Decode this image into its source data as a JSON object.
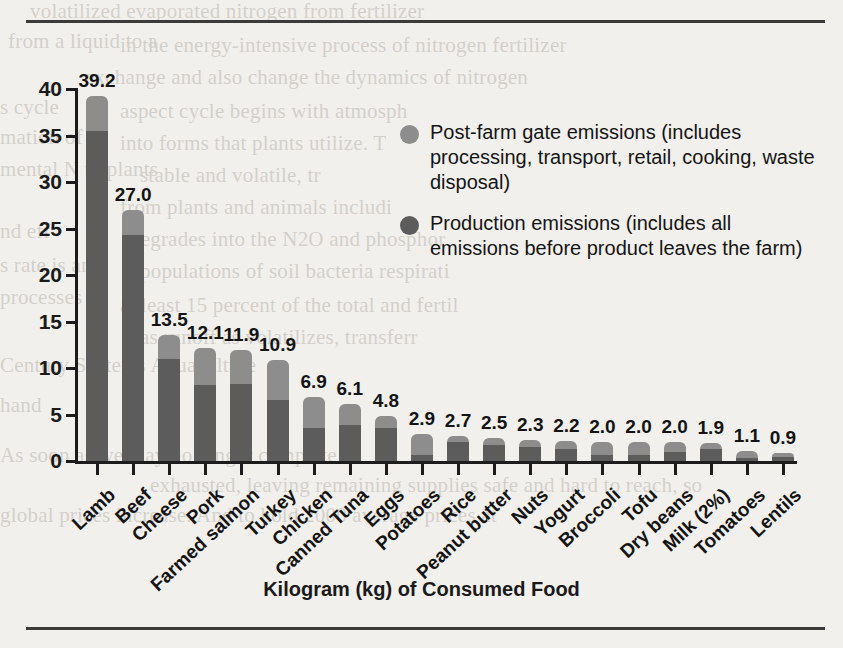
{
  "chart_data": {
    "type": "bar",
    "subtype": "stacked-bar",
    "title": "",
    "xlabel": "Kilogram (kg) of Consumed Food",
    "ylabel": "kg CO2e",
    "ylabel_parts": {
      "prefix": "kg CO",
      "sub": "2",
      "suffix": "e"
    },
    "ylim": [
      0,
      40
    ],
    "yticks": [
      0,
      5,
      10,
      15,
      20,
      25,
      30,
      35,
      40
    ],
    "grid": false,
    "legend_position": "upper-right-inside",
    "categories": [
      "Lamb",
      "Beef",
      "Cheese",
      "Pork",
      "Farmed salmon",
      "Turkey",
      "Chicken",
      "Canned Tuna",
      "Eggs",
      "Potatoes",
      "Rice",
      "Peanut butter",
      "Nuts",
      "Yogurt",
      "Broccoli",
      "Tofu",
      "Dry beans",
      "Milk (2%)",
      "Tomatoes",
      "Lentils"
    ],
    "totals": [
      39.2,
      27.0,
      13.5,
      12.1,
      11.9,
      10.9,
      6.9,
      6.1,
      4.8,
      2.9,
      2.7,
      2.5,
      2.3,
      2.2,
      2.0,
      2.0,
      2.0,
      1.9,
      1.1,
      0.9
    ],
    "series": [
      {
        "name": "Production emissions (includes all emissions before product leaves the farm)",
        "short_name": "Production emissions",
        "color": "#5c5c5c",
        "values": [
          35.5,
          24.3,
          11.0,
          8.2,
          8.3,
          6.6,
          3.5,
          3.9,
          3.5,
          0.6,
          2.0,
          1.7,
          1.5,
          1.3,
          0.7,
          0.7,
          1.0,
          1.3,
          0.3,
          0.4
        ]
      },
      {
        "name": "Post-farm gate emissions (includes processing, transport, retail, cooking, waste disposal)",
        "short_name": "Post-farm gate emissions",
        "color": "#8d8d8d",
        "values": [
          3.7,
          2.7,
          2.5,
          3.9,
          3.6,
          4.3,
          3.4,
          2.2,
          1.3,
          2.3,
          0.7,
          0.8,
          0.8,
          0.9,
          1.3,
          1.3,
          1.0,
          0.6,
          0.8,
          0.5
        ]
      }
    ]
  },
  "legend": {
    "items": [
      {
        "marker": "post",
        "label": "Post-farm gate emissions (includes processing, transport, retail, cooking, waste disposal)"
      },
      {
        "marker": "prod",
        "label": "Production emissions (includes all emissions before product leaves the farm)"
      }
    ]
  },
  "page_bleed": {
    "lines": [
      {
        "x": 30,
        "y": -4,
        "text": "volatilized evaporated nitrogen from fertilizer"
      },
      {
        "x": 8,
        "y": 26,
        "text": "from a liquid to a"
      },
      {
        "x": 120,
        "y": 30,
        "text": "in the energy-intensive process of nitrogen fertilizer"
      },
      {
        "x": 85,
        "y": 62,
        "text": "exchange and also change the dynamics of nitrogen"
      },
      {
        "x": 0,
        "y": 92,
        "text": "s cycle"
      },
      {
        "x": 120,
        "y": 96,
        "text": "aspect cycle begins with atmosph"
      },
      {
        "x": 0,
        "y": 122,
        "text": "mation of"
      },
      {
        "x": 120,
        "y": 128,
        "text": "into forms that plants utilize. T"
      },
      {
        "x": 0,
        "y": 154,
        "text": "mental N to plants"
      },
      {
        "x": 140,
        "y": 160,
        "text": "stable and volatile, tr"
      },
      {
        "x": 120,
        "y": 192,
        "text": "from plants and animals includi"
      },
      {
        "x": 0,
        "y": 216,
        "text": "nd eff"
      },
      {
        "x": 130,
        "y": 224,
        "text": "degrades into the N2O and phosphor"
      },
      {
        "x": 0,
        "y": 250,
        "text": "s rate is an"
      },
      {
        "x": 140,
        "y": 256,
        "text": "populations of soil bacteria respirati"
      },
      {
        "x": 0,
        "y": 282,
        "text": "processes"
      },
      {
        "x": 120,
        "y": 290,
        "text": "at least 15 percent of the total and fertil"
      },
      {
        "x": 140,
        "y": 322,
        "text": "as runoff as volatilizes, transferr"
      },
      {
        "x": 0,
        "y": 350,
        "text": "Century Systems Aquaculture"
      },
      {
        "x": 0,
        "y": 390,
        "text": "hand"
      },
      {
        "x": 0,
        "y": 440,
        "text": "As soon as we may no longer complete"
      },
      {
        "x": 150,
        "y": 470,
        "text": "exhausted, leaving remaining supplies safe and hard to reach, so"
      },
      {
        "x": 0,
        "y": 500,
        "text": "global prices increase. And to hold 2000 average prices at"
      }
    ]
  }
}
